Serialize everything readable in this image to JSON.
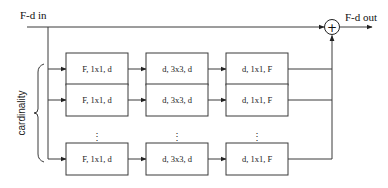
{
  "diagram": {
    "input_label": "F-d in",
    "output_label": "F-d out",
    "sum_symbol": "+",
    "group_label": "cardinality",
    "ellipsis": "⋮",
    "columns": [
      {
        "label": "F, 1x1, d"
      },
      {
        "label": "d, 3x3, d"
      },
      {
        "label": "d, 1x1, F"
      }
    ],
    "rows": [
      {
        "cells": [
          "F, 1x1, d",
          "d, 3x3, d",
          "d, 1x1, F"
        ]
      },
      {
        "cells": [
          "F, 1x1, d",
          "d, 3x3, d",
          "d, 1x1, F"
        ]
      },
      {
        "cells": [
          "F, 1x1, d",
          "d, 3x3, d",
          "d, 1x1, F"
        ]
      }
    ]
  }
}
